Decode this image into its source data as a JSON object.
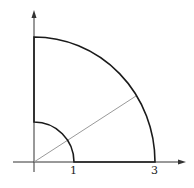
{
  "diagram": {
    "axes": {
      "x_arrow": true,
      "y_arrow": true
    },
    "tick_labels": [
      {
        "id": "x1",
        "text": "1",
        "value": 1
      },
      {
        "id": "x3",
        "text": "3",
        "value": 3
      }
    ],
    "inner_radius": 1,
    "outer_radius": 3,
    "ray_angle_deg": 30,
    "colors": {
      "boundary": "#1a1a1a",
      "axis": "#333333",
      "ray": "#9a9a9a"
    }
  }
}
